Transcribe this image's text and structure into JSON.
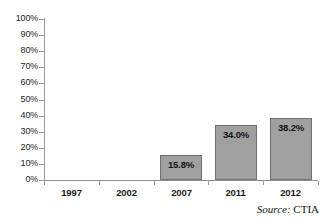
{
  "chart_data": {
    "type": "bar",
    "title": "",
    "subtitle": "",
    "xlabel": "",
    "ylabel": "",
    "categories": [
      "1997",
      "2002",
      "2007",
      "2011",
      "2012"
    ],
    "values": [
      0,
      0,
      15.8,
      34.0,
      38.2
    ],
    "data_labels": [
      "",
      "",
      "15.8%",
      "34.0%",
      "38.2%"
    ],
    "ylim": [
      0,
      100
    ],
    "ytick_values": [
      0,
      10,
      20,
      30,
      40,
      50,
      60,
      70,
      80,
      90,
      100
    ],
    "ytick_labels": [
      "0%",
      "10%",
      "20%",
      "30%",
      "40%",
      "50%",
      "60%",
      "70%",
      "80%",
      "90%",
      "100%"
    ],
    "grid": false,
    "legend": false,
    "legend_position": "none",
    "series": [
      {
        "name": "",
        "values": [
          0,
          0,
          15.8,
          34.0,
          38.2
        ]
      }
    ],
    "annotations": [
      {
        "name": "source-note",
        "label": "Source:",
        "value": "CTIA"
      }
    ],
    "colors": {
      "bar_fill": "#a0a0a0",
      "bar_border": "#6f6f6f",
      "axis": "#9a9a9a",
      "text": "#1b1b1b",
      "background": "#ffffff"
    }
  },
  "source": {
    "label": "Source:",
    "value": "CTIA"
  }
}
